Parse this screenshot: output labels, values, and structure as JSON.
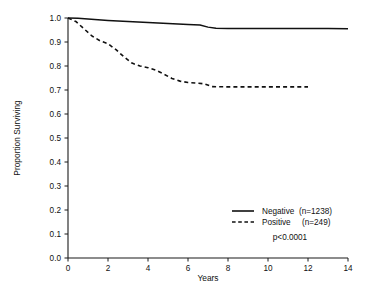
{
  "chart_data": {
    "type": "line",
    "title": "",
    "xlabel": "Years",
    "ylabel": "Proportion Surviving",
    "xlim": [
      0,
      14
    ],
    "ylim": [
      0.0,
      1.0
    ],
    "grid": false,
    "legend_position": "lower-right",
    "xticks": [
      0,
      2,
      4,
      6,
      8,
      10,
      12,
      14
    ],
    "xtick_labels": [
      "0",
      "2",
      "4",
      "6",
      "8",
      "10",
      "12",
      "14"
    ],
    "yticks": [
      0.0,
      0.1,
      0.2,
      0.3,
      0.4,
      0.5,
      0.6,
      0.7,
      0.8,
      0.9,
      1.0
    ],
    "ytick_labels": [
      "0.0",
      "0.1",
      "0.2",
      "0.3",
      "0.4",
      "0.5",
      "0.6",
      "0.7",
      "0.8",
      "0.9",
      "1.0"
    ],
    "annotations": [
      {
        "name": "p-value",
        "text": "p<0.0001",
        "x": 8.6,
        "y": 0.145
      }
    ],
    "series": [
      {
        "name": "Negative (n=1238)",
        "label": "Negative",
        "n": 1238,
        "n_label": "(n=1238)",
        "style": "solid",
        "color": "#111111",
        "x": [
          0.0,
          0.5,
          1.0,
          2.0,
          3.0,
          4.0,
          5.0,
          6.0,
          6.6,
          7.0,
          7.4,
          8.0,
          9.0,
          10.0,
          11.0,
          12.0,
          13.0,
          14.0
        ],
        "y": [
          1.0,
          0.999,
          0.996,
          0.99,
          0.985,
          0.981,
          0.977,
          0.973,
          0.971,
          0.962,
          0.957,
          0.956,
          0.956,
          0.956,
          0.956,
          0.956,
          0.956,
          0.955
        ]
      },
      {
        "name": "Positive (n=249)",
        "label": "Positive",
        "n": 249,
        "n_label": "(n=249)",
        "style": "dashed",
        "color": "#111111",
        "x": [
          0.0,
          0.4,
          0.8,
          1.2,
          1.6,
          2.0,
          2.4,
          2.8,
          3.2,
          3.6,
          4.0,
          4.4,
          4.8,
          5.2,
          5.6,
          6.0,
          6.4,
          6.8,
          7.2,
          8.0,
          9.0,
          10.0,
          11.0,
          12.0
        ],
        "y": [
          1.0,
          0.985,
          0.955,
          0.925,
          0.905,
          0.893,
          0.868,
          0.838,
          0.812,
          0.8,
          0.793,
          0.782,
          0.766,
          0.748,
          0.737,
          0.731,
          0.729,
          0.726,
          0.714,
          0.713,
          0.713,
          0.713,
          0.713,
          0.713
        ]
      }
    ],
    "legend": [
      {
        "style": "solid",
        "label": "Negative",
        "n_label": "(n=1238)"
      },
      {
        "style": "dashed",
        "label": "Positive",
        "n_label": "(n=249)"
      }
    ]
  }
}
